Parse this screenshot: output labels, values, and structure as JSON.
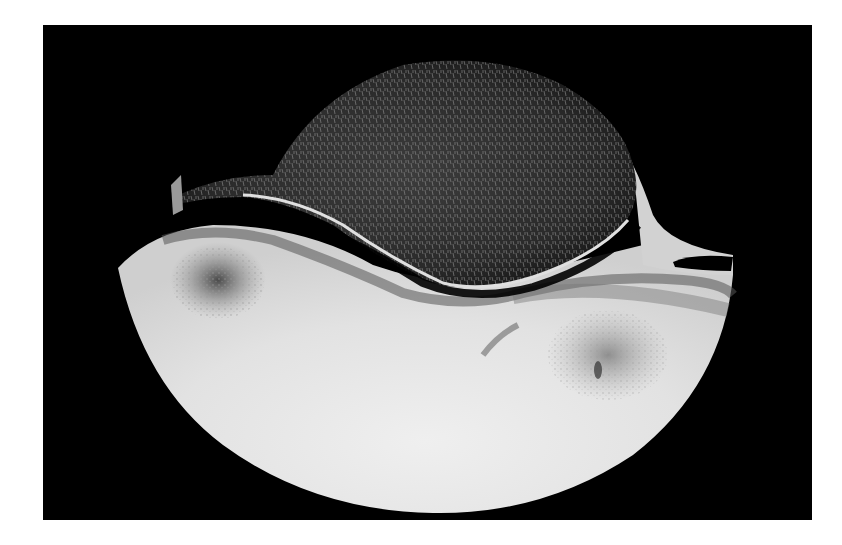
{
  "image": {
    "alt": "Grayscale axial radiographic cross-section of bone with trabecular upper bone over a bright dense lower bone",
    "background": "#000000",
    "frame": "#ffffff",
    "colors": {
      "dense_bone": "#e6e6e6",
      "trabecular": "#3a3a3a",
      "cortex": "#d8d8d8",
      "joint_space": "#000000"
    }
  }
}
